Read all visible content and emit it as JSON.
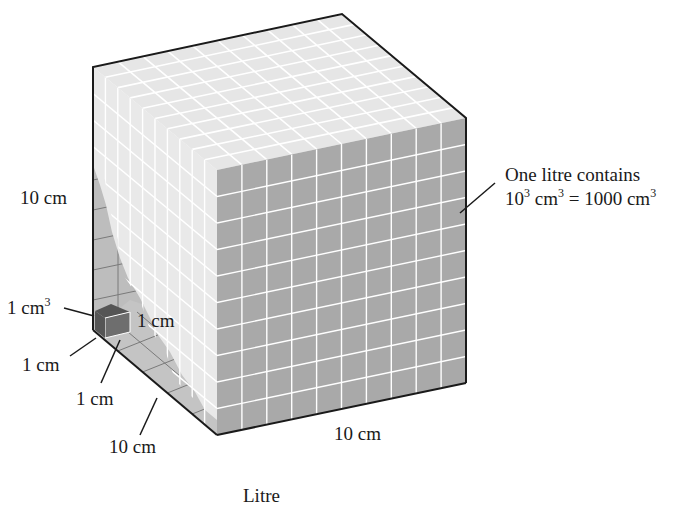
{
  "title": "Litre",
  "cube": {
    "grid_divisions": 10,
    "colors": {
      "top_face": "#e6e6e6",
      "front_face": "#a9a9a9",
      "left_stack": "#e9e9e9",
      "interior_back_wall": "#bdbdbd",
      "interior_floor": "#c4c4c4",
      "small_cube_front": "#6e6e6e",
      "small_cube_top": "#555555",
      "edge": "#1a1a1a",
      "grid_line_light": "#ffffff",
      "grid_line_dark": "#7a7a7a"
    }
  },
  "labels": {
    "height": "10 cm",
    "width": "10 cm",
    "depth": "10 cm",
    "unit_cube_volume_base": "1 cm",
    "unit_cube_volume_exp": "3",
    "unit_edge_1": "1 cm",
    "unit_edge_2": "1 cm",
    "unit_edge_3": "1 cm",
    "note_line1": "One litre contains",
    "note_line2_a": "10",
    "note_line2_a_exp": "3",
    "note_line2_b": " cm",
    "note_line2_b_exp": "3",
    "note_line2_c": " = 1000 cm",
    "note_line2_c_exp": "3"
  }
}
